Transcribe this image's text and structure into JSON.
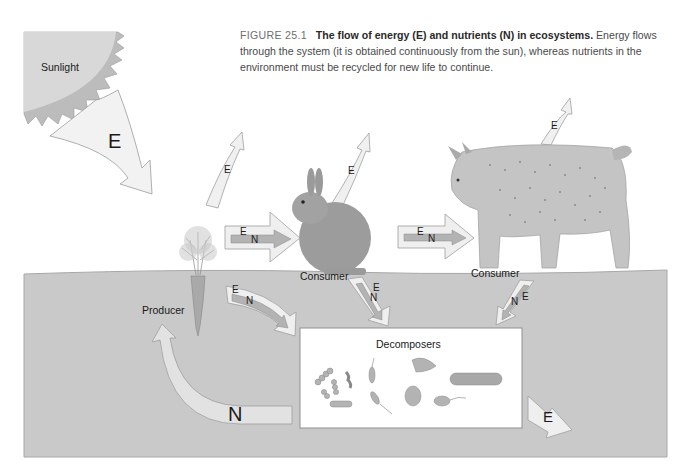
{
  "caption": {
    "figure_number": "FIGURE 25.1",
    "title": "The flow of energy (E) and nutrients (N) in ecosystems.",
    "body": "Energy flows through the system (it is obtained continuously from the sun), whereas nutrients in the environment must be recycled for new life to continue."
  },
  "labels": {
    "sunlight": "Sunlight",
    "producer": "Producer",
    "consumer_rabbit": "Consumer",
    "consumer_lynx": "Consumer",
    "decomposers": "Decomposers"
  },
  "arrows": {
    "sun_energy": "E",
    "producer_heat": "E",
    "rabbit_heat": "E",
    "lynx_heat": "E",
    "producer_to_rabbit_e": "E",
    "producer_to_rabbit_n": "N",
    "rabbit_to_lynx_e": "E",
    "rabbit_to_lynx_n": "N",
    "producer_to_decomp_e": "E",
    "producer_to_decomp_n": "N",
    "rabbit_to_decomp_e": "E",
    "rabbit_to_decomp_n": "N",
    "lynx_to_decomp_e": "E",
    "lynx_to_decomp_n": "N",
    "nutrient_recycle": "N",
    "decomp_heat": "E"
  },
  "colors": {
    "ground": "#c9c9c9",
    "sun": "#d4d4d4",
    "arrow_fill": "#f0f0f0",
    "inner_arrow": "#b5b5b5"
  }
}
